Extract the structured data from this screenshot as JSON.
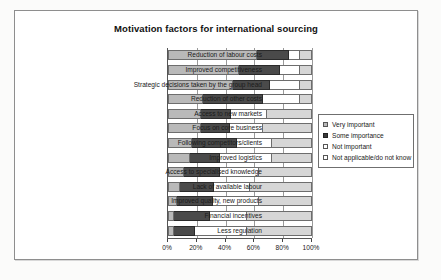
{
  "chart_data": {
    "type": "bar",
    "orientation": "horizontal",
    "stacked": true,
    "stacked_mode": "percent",
    "title": "Motivation factors for international sourcing",
    "xlabel": "",
    "ylabel": "",
    "xlim": [
      0,
      100
    ],
    "xticks": [
      "0%",
      "20%",
      "40%",
      "60%",
      "80%",
      "100%"
    ],
    "xtick_values": [
      0,
      20,
      40,
      60,
      80,
      100
    ],
    "grid": true,
    "legend_position": "right",
    "categories": [
      "Reduction of labour costs",
      "Improved competitiveness",
      "Strategic decisions taken by the group head",
      "Reduction of other costs",
      "Access to new markets",
      "Focus on core business",
      "Following competitors/clients",
      "Improved logistics",
      "Access to specialised knowledge",
      "Lack of available labour",
      "Improved quality, new products",
      "Financial incentives",
      "Less regulation"
    ],
    "series": [
      {
        "name": "Very important",
        "color": "#b9b9b9",
        "values": [
          62,
          49,
          45,
          24,
          23,
          23,
          17,
          15,
          11,
          8,
          6,
          4,
          4
        ]
      },
      {
        "name": "Some importance",
        "color": "#4a4a4a",
        "values": [
          22,
          29,
          26,
          42,
          21,
          20,
          31,
          21,
          25,
          24,
          25,
          25,
          15
        ]
      },
      {
        "name": "Not important",
        "color": "#ffffff",
        "values": [
          8,
          14,
          21,
          26,
          25,
          23,
          24,
          36,
          27,
          25,
          32,
          26,
          36
        ]
      },
      {
        "name": "Not applicable/do not know",
        "color": "#d6d6d6",
        "values": [
          8,
          8,
          8,
          8,
          31,
          34,
          28,
          28,
          37,
          43,
          37,
          45,
          45
        ]
      }
    ]
  },
  "legend": {
    "items": [
      "Very important",
      "Some importance",
      "Not important",
      "Not applicable/do not know"
    ]
  }
}
